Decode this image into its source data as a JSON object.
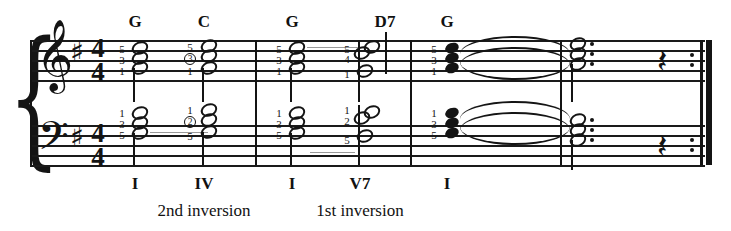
{
  "score": {
    "title_visible": false,
    "key_signature": "one-sharp",
    "key_name": "G major",
    "time_signature": {
      "top": "4",
      "bottom": "4"
    },
    "clefs": {
      "treble": "𝄞",
      "bass": "𝄢"
    },
    "sharp_glyph": "♯",
    "brace_glyph": "{",
    "rest_glyph": "𝄽"
  },
  "chord_symbols": [
    {
      "label": "G",
      "x": 135
    },
    {
      "label": "C",
      "x": 204
    },
    {
      "label": "G",
      "x": 292
    },
    {
      "label": "D7",
      "x": 385
    },
    {
      "label": "G",
      "x": 447
    }
  ],
  "roman_numerals": [
    {
      "label": "I",
      "x": 135
    },
    {
      "label": "IV",
      "x": 204
    },
    {
      "label": "I",
      "x": 292
    },
    {
      "label": "V7",
      "x": 360
    },
    {
      "label": "I",
      "x": 447
    }
  ],
  "inversion_labels": [
    {
      "label": "2nd inversion",
      "x": 204
    },
    {
      "label": "1st inversion",
      "x": 360
    }
  ],
  "fingerings": {
    "treble": [
      {
        "chord": "G",
        "numbers": [
          "5",
          "3",
          "1"
        ],
        "circled": [
          false,
          false,
          false
        ]
      },
      {
        "chord": "C",
        "numbers": [
          "5",
          "3",
          "1"
        ],
        "circled": [
          false,
          true,
          false
        ]
      },
      {
        "chord": "G",
        "numbers": [
          "5",
          "3",
          "1"
        ],
        "circled": [
          false,
          false,
          false
        ]
      },
      {
        "chord": "D7",
        "numbers": [
          "5",
          "4",
          "1"
        ],
        "circled": [
          false,
          false,
          false
        ]
      },
      {
        "chord": "G",
        "numbers": [
          "5",
          "3",
          "1"
        ],
        "circled": [
          false,
          false,
          false
        ]
      }
    ],
    "bass": [
      {
        "chord": "G",
        "numbers": [
          "1",
          "3",
          "5"
        ],
        "circled": [
          false,
          false,
          false
        ]
      },
      {
        "chord": "C",
        "numbers": [
          "1",
          "2",
          "5"
        ],
        "circled": [
          false,
          true,
          false
        ]
      },
      {
        "chord": "G",
        "numbers": [
          "1",
          "3",
          "5"
        ],
        "circled": [
          false,
          false,
          false
        ]
      },
      {
        "chord": "D7",
        "numbers": [
          "1",
          "2",
          "5"
        ],
        "circled": [
          false,
          false,
          false
        ]
      },
      {
        "chord": "G",
        "numbers": [
          "1",
          "3",
          "5"
        ],
        "circled": [
          false,
          false,
          false
        ]
      }
    ]
  },
  "measures": [
    {
      "index": 1,
      "chords": [
        "G",
        "C"
      ]
    },
    {
      "index": 2,
      "chords": [
        "G",
        "D7"
      ]
    },
    {
      "index": 3,
      "chords": [
        "G"
      ]
    },
    {
      "index": 4,
      "chords": [
        "G",
        "rest"
      ]
    }
  ],
  "ending": {
    "has_repeat_barline": true,
    "repeat_dots_per_staff": 2,
    "final_rest": "quarter-rest"
  },
  "colors": {
    "ink": "#141414",
    "paper": "#ffffff",
    "faint": "#9a9a9a"
  }
}
